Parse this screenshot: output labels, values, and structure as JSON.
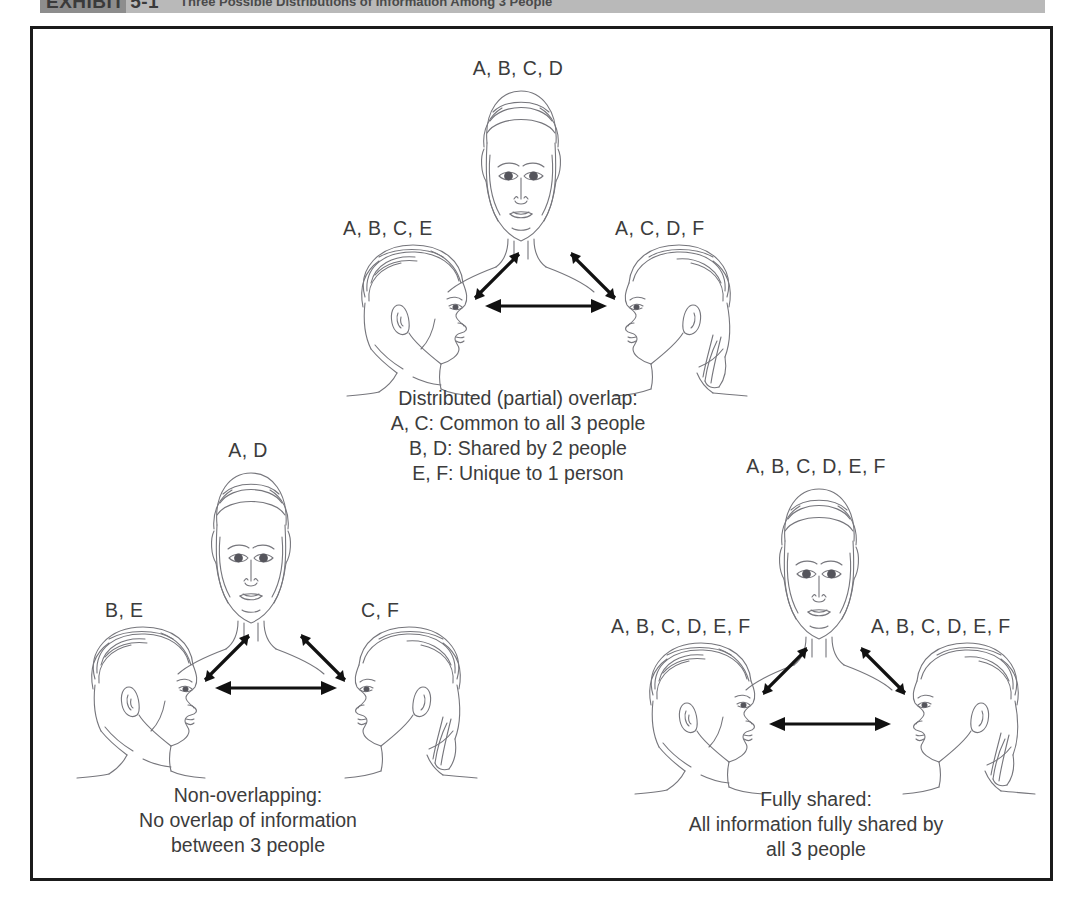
{
  "header": {
    "exhibit_label": "EXHIBIT 5-1",
    "title": "Three Possible Distributions of Information Among 3 People"
  },
  "figure": {
    "groups": [
      {
        "id": "distributed-overlap",
        "labels": {
          "top": "A, B, C, D",
          "left": "A, B, C, E",
          "right": "A, C, D, F"
        },
        "caption": [
          "Distributed (partial) overlap:",
          "A, C: Common to all 3 people",
          "B, D: Shared by 2 people",
          "E, F: Unique to 1 person"
        ]
      },
      {
        "id": "non-overlapping",
        "labels": {
          "top": "A, D",
          "left": "B, E",
          "right": "C, F"
        },
        "caption": [
          "Non-overlapping:",
          "No overlap of information",
          "between 3 people"
        ]
      },
      {
        "id": "fully-shared",
        "labels": {
          "top": "A, B, C, D, E, F",
          "left": "A, B, C, D, E, F",
          "right": "A, B, C, D, E, F"
        },
        "caption": [
          "Fully shared:",
          "All information fully shared by",
          "all 3 people"
        ]
      }
    ],
    "icons": {
      "front_face": "front-facing-head-icon",
      "left_profile": "left-profile-head-icon",
      "right_profile": "right-profile-head-icon",
      "arrow": "double-headed-arrow-icon"
    },
    "colors": {
      "frame_border": "#1b1b1b",
      "text": "#3c3c3c",
      "arrow": "#111111",
      "line_art": "#6e6e73",
      "header_band": "#b9b9b9",
      "header_swatch": "#8d8d8d"
    }
  }
}
